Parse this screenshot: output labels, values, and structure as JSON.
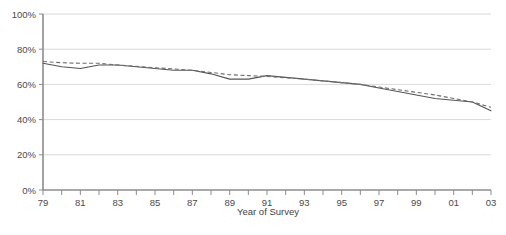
{
  "chart_data": {
    "type": "line",
    "title": "",
    "xlabel": "Year of Survey",
    "ylabel": "",
    "xlim": [
      1979,
      2003
    ],
    "ylim": [
      0,
      100
    ],
    "grid": true,
    "legend": "none",
    "y_ticks": [
      "0%",
      "20%",
      "40%",
      "60%",
      "80%",
      "100%"
    ],
    "y_tick_values": [
      0,
      20,
      40,
      60,
      80,
      100
    ],
    "x_ticks": [
      "79",
      "81",
      "83",
      "85",
      "87",
      "89",
      "91",
      "93",
      "95",
      "97",
      "99",
      "01",
      "03"
    ],
    "x_tick_values": [
      1979,
      1981,
      1983,
      1985,
      1987,
      1989,
      1991,
      1993,
      1995,
      1997,
      1999,
      2001,
      2003
    ],
    "x_minor_tick_values": [
      1980,
      1982,
      1984,
      1986,
      1988,
      1990,
      1992,
      1994,
      1996,
      1998,
      2000,
      2002
    ],
    "x": [
      1979,
      1980,
      1981,
      1982,
      1983,
      1984,
      1985,
      1986,
      1987,
      1988,
      1989,
      1990,
      1991,
      1992,
      1993,
      1994,
      1995,
      1996,
      1997,
      1998,
      1999,
      2000,
      2001,
      2002,
      2003
    ],
    "series": [
      {
        "name": "Survey response rate",
        "style": "solid",
        "color": "#555555",
        "values": [
          72,
          70,
          69,
          71,
          71,
          70,
          69,
          68,
          68,
          66,
          63,
          63,
          65,
          64,
          63,
          62,
          61,
          60,
          58,
          56,
          54,
          52,
          51,
          50,
          45
        ]
      },
      {
        "name": "Linear trend",
        "style": "dashed",
        "color": "#6e6e6e",
        "values": [
          73,
          72.3,
          72,
          72,
          71,
          70.3,
          69.5,
          68.8,
          68,
          66.8,
          65.5,
          65,
          64.5,
          63.8,
          63,
          62,
          61,
          60,
          58.5,
          57,
          55.5,
          54,
          52,
          50,
          47
        ]
      }
    ]
  },
  "axis": {
    "x_title": "Year of Survey"
  }
}
